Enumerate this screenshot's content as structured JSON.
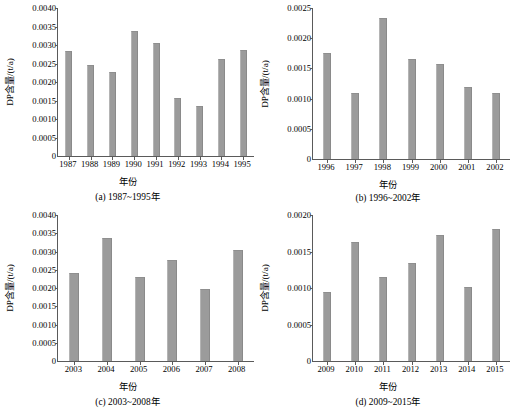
{
  "figure": {
    "axis_title_x": "年份",
    "axis_title_y": "DP含量/(t/a)",
    "bar_color": "#9b9b9b",
    "axis_color": "#5a5a5a",
    "background": "#ffffff"
  },
  "chart_data": [
    {
      "type": "bar",
      "panel": "a",
      "caption": "(a) 1987~1995年",
      "title": "",
      "xlabel": "年份",
      "ylabel": "DP含量/(t/a)",
      "categories": [
        "1987",
        "1988",
        "1989",
        "1990",
        "1991",
        "1992",
        "1993",
        "1994",
        "1995"
      ],
      "values": [
        0.00283,
        0.00247,
        0.00227,
        0.00338,
        0.00306,
        0.00158,
        0.00135,
        0.00262,
        0.00286
      ],
      "ylim": [
        0,
        0.004
      ],
      "ytick_step": 0.0005,
      "ytick_labels": [
        "0",
        "0.0005",
        "0.0010",
        "0.0015",
        "0.0020",
        "0.0025",
        "0.0030",
        "0.0035",
        "0.0040"
      ],
      "grid": false,
      "legend": "none"
    },
    {
      "type": "bar",
      "panel": "b",
      "caption": "(b) 1996~2002年",
      "title": "",
      "xlabel": "年份",
      "ylabel": "DP含量/(t/a)",
      "categories": [
        "1996",
        "1997",
        "1998",
        "1999",
        "2000",
        "2001",
        "2002"
      ],
      "values": [
        0.00175,
        0.00109,
        0.00233,
        0.00166,
        0.00157,
        0.00119,
        0.0011
      ],
      "ylim": [
        0,
        0.0025
      ],
      "ytick_step": 0.0005,
      "ytick_labels": [
        "0",
        "0.0005",
        "0.0010",
        "0.0015",
        "0.0020",
        "0.0025"
      ],
      "grid": false,
      "legend": "none"
    },
    {
      "type": "bar",
      "panel": "c",
      "caption": "(c) 2003~2008年",
      "title": "",
      "xlabel": "年份",
      "ylabel": "DP含量/(t/a)",
      "categories": [
        "2003",
        "2004",
        "2005",
        "2006",
        "2007",
        "2008"
      ],
      "values": [
        0.00241,
        0.00337,
        0.00231,
        0.00277,
        0.00196,
        0.00304
      ],
      "ylim": [
        0,
        0.004
      ],
      "ytick_step": 0.0005,
      "ytick_labels": [
        "0",
        "0.0005",
        "0.0010",
        "0.0015",
        "0.0020",
        "0.0025",
        "0.0030",
        "0.0035",
        "0.0040"
      ],
      "grid": false,
      "legend": "none"
    },
    {
      "type": "bar",
      "panel": "d",
      "caption": "(d) 2009~2015年",
      "title": "",
      "xlabel": "年份",
      "ylabel": "DP含量/(t/a)",
      "categories": [
        "2009",
        "2010",
        "2011",
        "2012",
        "2013",
        "2014",
        "2015"
      ],
      "values": [
        0.00095,
        0.00163,
        0.00115,
        0.00134,
        0.00173,
        0.00102,
        0.00181
      ],
      "ylim": [
        0,
        0.002
      ],
      "ytick_step": 0.0005,
      "ytick_labels": [
        "0",
        "0.0005",
        "0.0010",
        "0.0015",
        "0.0020"
      ],
      "grid": false,
      "legend": "none"
    }
  ]
}
